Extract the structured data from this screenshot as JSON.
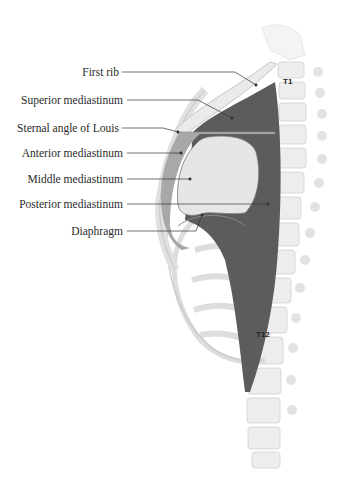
{
  "figure": {
    "type": "anatomical-diagram",
    "labels": [
      {
        "id": "first-rib",
        "text": "First rib"
      },
      {
        "id": "superior-mediastinum",
        "text": "Superior mediastinum"
      },
      {
        "id": "sternal-angle",
        "text": "Sternal angle of Louis"
      },
      {
        "id": "anterior-mediastinum",
        "text": "Anterior mediastinum"
      },
      {
        "id": "middle-mediastinum",
        "text": "Middle mediastinum"
      },
      {
        "id": "posterior-mediastinum",
        "text": "Posterior mediastinum"
      },
      {
        "id": "diaphragm",
        "text": "Diaphragm"
      }
    ],
    "vertebra_labels": {
      "t1": "T1",
      "t12": "T12"
    },
    "colors": {
      "superior_posterior": "#5c5c5c",
      "anterior": "#a8a8a8",
      "middle": "#e6e6e6",
      "bone": "#efefef",
      "bone_shadow": "#c8c8c8",
      "leader": "#333333"
    }
  }
}
